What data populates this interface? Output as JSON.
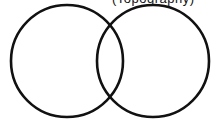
{
  "diagram": {
    "type": "venn",
    "caption": "(Topography)",
    "stroke_color": "#111111",
    "background": "#ffffff",
    "circles": [
      {
        "id": "left",
        "cx": 67,
        "cy": 61,
        "r": 56
      },
      {
        "id": "right",
        "cx": 153,
        "cy": 61,
        "r": 56
      }
    ]
  }
}
